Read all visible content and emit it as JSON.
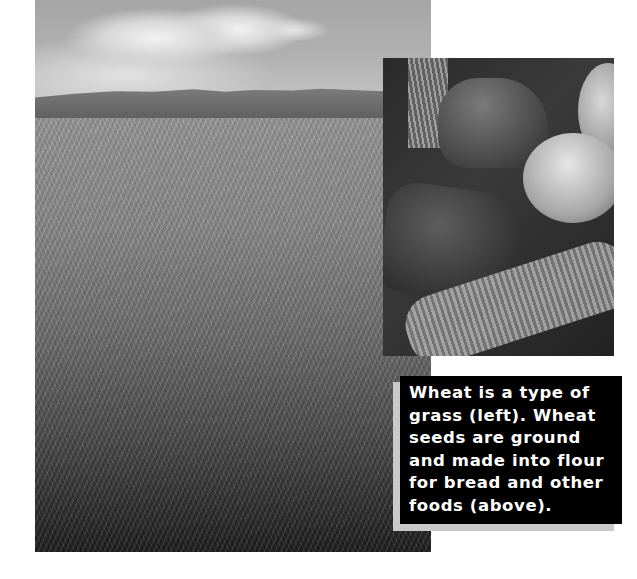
{
  "photos": {
    "wheat_field": {
      "alt": "Wheat field with hills and clouds in the background"
    },
    "bread": {
      "alt": "Loaves of bread in a basket with wheat stalks"
    }
  },
  "caption": {
    "text": "Wheat is a type of\ngrass (left). Wheat\nseeds are ground\nand made into flour\nfor bread and other\nfoods (above).",
    "background_color": "#000000",
    "text_color": "#ffffff",
    "shadow_color": "#c9c9c9"
  }
}
